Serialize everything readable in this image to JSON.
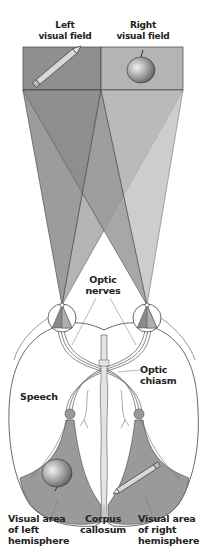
{
  "labels": {
    "left_visual_field": "Left\nvisual field",
    "right_visual_field": "Right\nvisual field",
    "optic_nerves": "Optic\nnerves",
    "optic_chiasm": "Optic\nchiasm",
    "speech": "Speech",
    "visual_area_left": "Visual area\nof left\nhemisphere",
    "corpus_callosum": "Corpus\ncallosum",
    "visual_area_right": "Visual area\nof right\nhemisphere"
  },
  "objects": {
    "left_field_object": "pencil",
    "right_field_object": "apple",
    "left_hemisphere_object": "apple",
    "right_hemisphere_object": "pencil"
  },
  "colors": {
    "left_field": "#8f8f8f",
    "right_field": "#b4b4b4",
    "dark_cone": "#7a7a7a",
    "mid_cone": "#9c9c9c",
    "light_cone": "#c4c4c4",
    "visual_area": "#9a9a9a",
    "outline": "#333333"
  }
}
